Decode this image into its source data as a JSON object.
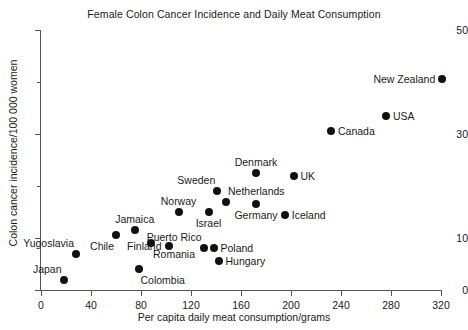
{
  "chart_data": {
    "type": "scatter",
    "title": "Female Colon Cancer Incidence and Daily Meat Consumption",
    "xlabel": "Per capita daily meat consumption/grams",
    "ylabel": "Colon cancer incidence/100 000 women",
    "xlim": [
      0,
      320
    ],
    "ylim": [
      0,
      50
    ],
    "xticks": [
      0,
      40,
      80,
      120,
      160,
      200,
      240,
      280,
      320
    ],
    "yticks": [
      0,
      10,
      30,
      50
    ],
    "y_minor_ticks": [
      20,
      40
    ],
    "grid": false,
    "legend": null,
    "marker_color": "#111111",
    "axis_color": "#555555",
    "points": [
      {
        "label": "Japan",
        "x": 18,
        "y": 2.0,
        "label_pos": "above-left"
      },
      {
        "label": "Colombia",
        "x": 78,
        "y": 4.0,
        "label_pos": "below-right"
      },
      {
        "label": "Yugoslavia",
        "x": 28,
        "y": 7.0,
        "label_pos": "above-left"
      },
      {
        "label": "Chile",
        "x": 60,
        "y": 10.5,
        "label_pos": "below-left"
      },
      {
        "label": "Jamaica",
        "x": 75,
        "y": 11.5,
        "label_pos": "above-center"
      },
      {
        "label": "Romania",
        "x": 88,
        "y": 9.0,
        "label_pos": "below-right"
      },
      {
        "label": "Finland",
        "x": 102,
        "y": 8.5,
        "label_pos": "left"
      },
      {
        "label": "Norway",
        "x": 110,
        "y": 15.0,
        "label_pos": "above-center"
      },
      {
        "label": "Puerto Rico",
        "x": 130,
        "y": 8.0,
        "label_pos": "above-left"
      },
      {
        "label": "Poland",
        "x": 138,
        "y": 8.0,
        "label_pos": "right"
      },
      {
        "label": "Hungary",
        "x": 142,
        "y": 5.5,
        "label_pos": "right"
      },
      {
        "label": "Israel",
        "x": 134,
        "y": 15.0,
        "label_pos": "below-center"
      },
      {
        "label": "Sweden",
        "x": 141,
        "y": 19.0,
        "label_pos": "above-left"
      },
      {
        "label": "Netherlands",
        "x": 148,
        "y": 17.0,
        "label_pos": "above-right"
      },
      {
        "label": "Denmark",
        "x": 172,
        "y": 22.5,
        "label_pos": "above-center"
      },
      {
        "label": "Germany",
        "x": 172,
        "y": 16.5,
        "label_pos": "below-center"
      },
      {
        "label": "Iceland",
        "x": 195,
        "y": 14.5,
        "label_pos": "right"
      },
      {
        "label": "UK",
        "x": 202,
        "y": 22.0,
        "label_pos": "right"
      },
      {
        "label": "Canada",
        "x": 232,
        "y": 30.5,
        "label_pos": "right"
      },
      {
        "label": "USA",
        "x": 276,
        "y": 33.5,
        "label_pos": "right"
      },
      {
        "label": "New Zealand",
        "x": 321,
        "y": 40.5,
        "label_pos": "left"
      }
    ]
  }
}
